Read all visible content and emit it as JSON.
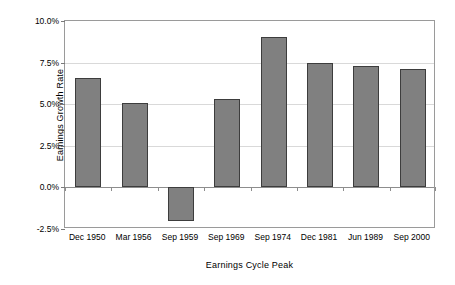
{
  "chart_data": {
    "type": "bar",
    "title": "",
    "xlabel": "Earnings Cycle Peak",
    "ylabel": "Earnings Growth Rate",
    "categories": [
      "Dec 1950",
      "Mar 1956",
      "Sep 1959",
      "Sep 1969",
      "Sep 1974",
      "Dec 1981",
      "Jun 1989",
      "Sep 2000"
    ],
    "values": [
      6.6,
      5.1,
      -2.0,
      5.3,
      9.05,
      7.45,
      7.3,
      7.1
    ],
    "value_labels": [
      "6.6%",
      "5.1%",
      "-2.0%",
      "5.3%",
      "9.05%",
      "7.45%",
      "7.3%",
      "7.1%"
    ],
    "ylim": [
      -2.5,
      10.0
    ],
    "yticks": [
      10.0,
      7.5,
      5.0,
      2.5,
      0.0,
      -2.5
    ],
    "ytick_labels": [
      "10.0%",
      "7.5%",
      "5.0%",
      "2.5%",
      "0.0%",
      "-2.5%"
    ],
    "grid": true,
    "legend": false,
    "legend_position": "none",
    "bar_color": "#808080",
    "bar_edge_color": "#3d3d3d",
    "gridline_color": "#d9d9d9",
    "axis_color": "#9a9a9a",
    "background_color": "#ffffff"
  }
}
